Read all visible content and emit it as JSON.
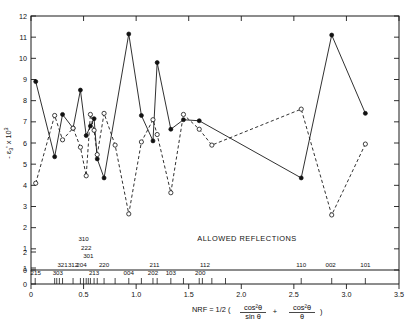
{
  "chart_data": {
    "type": "line",
    "title": "",
    "xlabel": "NRF = 1/2 ( cos²θ/sin θ + cos²θ/θ )",
    "ylabel": "- ε₃' x 10³",
    "xlim": [
      0,
      3.5
    ],
    "ylim": [
      0,
      12
    ],
    "grid": false,
    "legend": null,
    "xticks": [
      0,
      0.5,
      1.0,
      1.5,
      2.0,
      2.5,
      3.0,
      3.5
    ],
    "xticklabels": [
      "0",
      "0.5",
      "1.0",
      "1.5",
      "2.0",
      "2.5",
      "3.0",
      "3.5"
    ],
    "yticks": [
      0,
      1,
      2,
      3,
      4,
      5,
      6,
      7,
      8,
      9,
      10,
      11,
      12
    ],
    "yticklabels": [
      "0",
      "1",
      "2",
      "3",
      "4",
      "5",
      "6",
      "7",
      "8",
      "9",
      "10",
      "11",
      "12"
    ],
    "annotations": {
      "allowed_reflections": "ALLOWED REFLECTIONS"
    },
    "reflections": [
      {
        "label": "215",
        "x": 0.045,
        "row": 0
      },
      {
        "label": "303",
        "x": 0.255,
        "row": 0
      },
      {
        "label": "321",
        "x": 0.3,
        "row": 1
      },
      {
        "label": "312",
        "x": 0.4,
        "row": 1
      },
      {
        "label": "204",
        "x": 0.48,
        "row": 1
      },
      {
        "label": "301",
        "x": 0.545,
        "row": 2
      },
      {
        "label": "222",
        "x": 0.525,
        "row": 3
      },
      {
        "label": "310",
        "x": 0.5,
        "row": 4
      },
      {
        "label": "213",
        "x": 0.6,
        "row": 0
      },
      {
        "label": "220",
        "x": 0.695,
        "row": 1
      },
      {
        "label": "004",
        "x": 0.93,
        "row": 0
      },
      {
        "label": "202",
        "x": 1.16,
        "row": 0
      },
      {
        "label": "211",
        "x": 1.175,
        "row": 1
      },
      {
        "label": "103",
        "x": 1.33,
        "row": 0
      },
      {
        "label": "200",
        "x": 1.61,
        "row": 0
      },
      {
        "label": "112",
        "x": 1.655,
        "row": 1
      },
      {
        "label": "110",
        "x": 2.57,
        "row": 1
      },
      {
        "label": "002",
        "x": 2.85,
        "row": 1
      },
      {
        "label": "101",
        "x": 3.18,
        "row": 1
      }
    ],
    "reflection_ticks": [
      0.04,
      0.225,
      0.245,
      0.27,
      0.3,
      0.4,
      0.47,
      0.5,
      0.525,
      0.545,
      0.565,
      0.6,
      0.63,
      0.695,
      0.8,
      0.93,
      1.05,
      1.16,
      1.2,
      1.33,
      1.45,
      1.6,
      1.63,
      1.72,
      1.85,
      2.57,
      2.86,
      3.18
    ],
    "series": [
      {
        "name": "solid-filled",
        "style": "solid",
        "marker": "filled-circle",
        "points": [
          [
            0.045,
            8.9
          ],
          [
            0.225,
            5.35
          ],
          [
            0.3,
            7.35
          ],
          [
            0.4,
            6.7
          ],
          [
            0.47,
            8.5
          ],
          [
            0.525,
            6.35
          ],
          [
            0.565,
            6.8
          ],
          [
            0.6,
            7.15
          ],
          [
            0.63,
            5.25
          ],
          [
            0.695,
            4.35
          ],
          [
            0.93,
            11.15
          ],
          [
            1.05,
            7.3
          ],
          [
            1.16,
            6.1
          ],
          [
            1.2,
            9.8
          ],
          [
            1.33,
            6.65
          ],
          [
            1.45,
            7.1
          ],
          [
            1.6,
            7.05
          ],
          [
            2.57,
            4.35
          ],
          [
            2.86,
            11.1
          ],
          [
            3.18,
            7.4
          ]
        ]
      },
      {
        "name": "dashed-open",
        "style": "dashed",
        "marker": "open-circle",
        "points": [
          [
            0.045,
            4.1
          ],
          [
            0.225,
            7.3
          ],
          [
            0.3,
            6.15
          ],
          [
            0.4,
            6.7
          ],
          [
            0.47,
            5.8
          ],
          [
            0.525,
            4.45
          ],
          [
            0.565,
            7.35
          ],
          [
            0.6,
            6.6
          ],
          [
            0.63,
            5.45
          ],
          [
            0.695,
            7.4
          ],
          [
            0.8,
            5.9
          ],
          [
            0.93,
            2.65
          ],
          [
            1.05,
            6.05
          ],
          [
            1.16,
            7.1
          ],
          [
            1.2,
            6.4
          ],
          [
            1.33,
            3.65
          ],
          [
            1.45,
            7.35
          ],
          [
            1.6,
            6.65
          ],
          [
            1.72,
            5.9
          ],
          [
            2.57,
            7.6
          ],
          [
            2.86,
            2.6
          ],
          [
            3.18,
            5.95
          ]
        ]
      }
    ]
  }
}
